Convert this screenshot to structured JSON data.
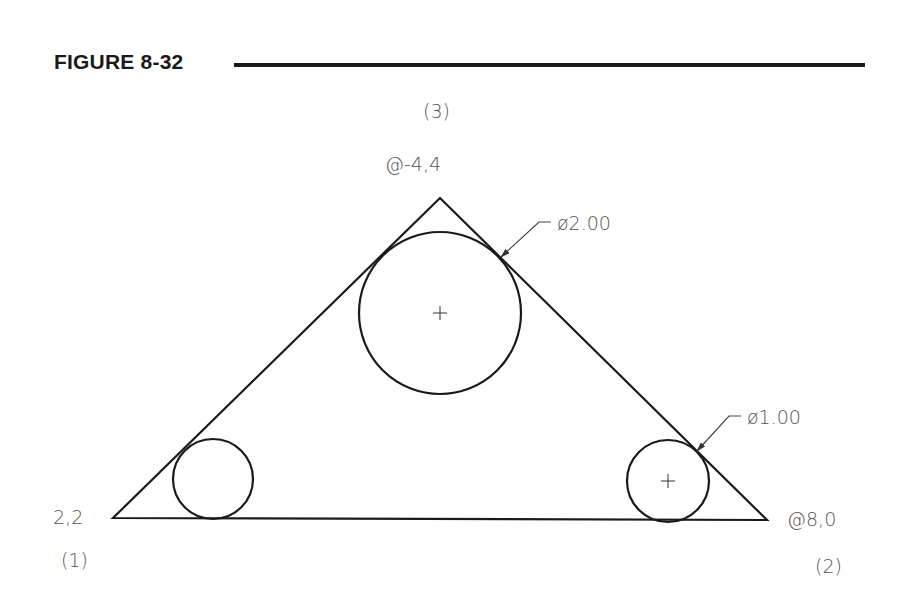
{
  "figure": {
    "title": "FIGURE 8-32"
  },
  "points": [
    {
      "id": "p1",
      "order_label": "(1)",
      "coord_label": "2,2"
    },
    {
      "id": "p2",
      "order_label": "(2)",
      "coord_label": "@8,0"
    },
    {
      "id": "p3",
      "order_label": "(3)",
      "coord_label": "@-4,4"
    }
  ],
  "dimensions": [
    {
      "id": "big-circle-diameter",
      "label": "ø2.00"
    },
    {
      "id": "small-circle-diameter",
      "label": "ø1.00"
    }
  ],
  "geometry": {
    "triangle": {
      "vertices": [
        [
          113,
          518
        ],
        [
          767,
          520
        ],
        [
          440,
          198
        ]
      ]
    },
    "circles": [
      {
        "name": "large-inscribed-circle",
        "cx": 440,
        "cy": 313,
        "r": 81,
        "center_mark": true
      },
      {
        "name": "small-left-circle",
        "cx": 213,
        "cy": 479,
        "r": 40,
        "center_mark": false
      },
      {
        "name": "small-right-circle",
        "cx": 668,
        "cy": 481,
        "r": 41,
        "center_mark": true
      }
    ],
    "line_color": "#1a1a1a",
    "text_color": "#555555"
  }
}
